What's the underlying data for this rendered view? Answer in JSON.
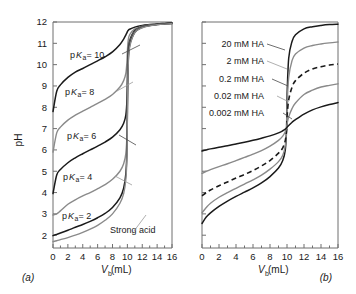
{
  "figure": {
    "panel_a_label": "(a)",
    "panel_b_label": "(b)"
  },
  "axes": {
    "y_title": "pH",
    "x_title_main": "V",
    "x_title_sub": "b",
    "x_title_unit": " (mL)",
    "x_ticklabels": [
      "0",
      "2",
      "4",
      "6",
      "8",
      "10",
      "12",
      "14",
      "16"
    ],
    "y_ticklabels": [
      "2",
      "3",
      "4",
      "5",
      "6",
      "7",
      "8",
      "9",
      "10",
      "11",
      "12"
    ],
    "xlim": [
      0,
      16
    ],
    "ylim": [
      1.4,
      12
    ],
    "x_major_step": 2,
    "y_major_step": 1
  },
  "panel_a": {
    "annotations": [
      {
        "prefix": "p",
        "italic": "K",
        "sub": "a",
        "suffix": " = 10",
        "color": "#1a1a1a"
      },
      {
        "prefix": "p",
        "italic": "K",
        "sub": "a",
        "suffix": " = 8",
        "color": "#8a8a8a"
      },
      {
        "prefix": "p",
        "italic": "K",
        "sub": "a",
        "suffix": " = 6",
        "color": "#1a1a1a"
      },
      {
        "prefix": "p",
        "italic": "K",
        "sub": "a",
        "suffix": " = 4",
        "color": "#8a8a8a"
      },
      {
        "prefix": "p",
        "italic": "K",
        "sub": "a",
        "suffix": " = 2",
        "color": "#1a1a1a"
      },
      {
        "prefix": "",
        "italic": "",
        "sub": "",
        "suffix": "Strong acid",
        "color": "#8a8a8a"
      }
    ]
  },
  "panel_b": {
    "annotations": [
      {
        "label": "20 mM HA",
        "color": "#1a1a1a"
      },
      {
        "label": "2 mM HA",
        "color": "#8a8a8a"
      },
      {
        "label": "0.2 mM HA",
        "color": "#1a1a1a"
      },
      {
        "label": "0.02 mM HA",
        "color": "#8a8a8a"
      },
      {
        "label": "0.002 mM HA",
        "color": "#1a1a1a"
      }
    ]
  },
  "chart_data": {
    "type": "line",
    "title": "",
    "xlabel": "V_b (mL)",
    "ylabel": "pH",
    "xlim": [
      0,
      16
    ],
    "ylim": [
      1.4,
      12
    ],
    "grid": false,
    "legend_position": "inline-annotations",
    "panels": [
      {
        "id": "a",
        "label": "(a)",
        "description": "Titration curves of weak acids of differing pKa with strong base; equivalence point at Vb = 10 mL",
        "series": [
          {
            "name": "pKa = 10",
            "color": "#1a1a1a",
            "style": "solid",
            "x": [
              0,
              0.5,
              1,
              2,
              3,
              4,
              5,
              6,
              7,
              8,
              9,
              9.5,
              9.8,
              9.95,
              10,
              10.1,
              10.3,
              11,
              12,
              13,
              14,
              15,
              16
            ],
            "y": [
              7.8,
              8.75,
              9.05,
              9.4,
              9.65,
              9.82,
              10.0,
              10.18,
              10.37,
              10.6,
              10.95,
              11.2,
              11.4,
              11.5,
              11.55,
              11.6,
              11.66,
              11.76,
              11.84,
              11.88,
              11.91,
              11.93,
              11.95
            ]
          },
          {
            "name": "pKa = 8",
            "color": "#8a8a8a",
            "style": "solid",
            "x": [
              0,
              0.5,
              1,
              2,
              3,
              4,
              5,
              6,
              7,
              8,
              9,
              9.5,
              9.8,
              9.95,
              10,
              10.1,
              10.3,
              11,
              12,
              13,
              14,
              15,
              16
            ],
            "y": [
              5.9,
              6.8,
              7.07,
              7.4,
              7.63,
              7.82,
              8.0,
              8.18,
              8.37,
              8.6,
              8.95,
              9.25,
              9.6,
              10.2,
              10.6,
              11.1,
              11.4,
              11.68,
              11.8,
              11.86,
              11.89,
              11.92,
              11.94
            ]
          },
          {
            "name": "pKa = 6",
            "color": "#1a1a1a",
            "style": "solid",
            "x": [
              0,
              0.5,
              1,
              2,
              3,
              4,
              5,
              6,
              7,
              8,
              9,
              9.5,
              9.8,
              9.95,
              10,
              10.1,
              10.3,
              11,
              12,
              13,
              14,
              15,
              16
            ],
            "y": [
              3.95,
              4.82,
              5.08,
              5.4,
              5.63,
              5.82,
              6.0,
              6.18,
              6.37,
              6.6,
              6.95,
              7.25,
              7.65,
              8.4,
              9.4,
              10.5,
              11.1,
              11.6,
              11.78,
              11.85,
              11.89,
              11.92,
              11.94
            ]
          },
          {
            "name": "pKa = 4",
            "color": "#8a8a8a",
            "style": "solid",
            "x": [
              0,
              0.5,
              1,
              2,
              3,
              4,
              5,
              6,
              7,
              8,
              9,
              9.5,
              9.8,
              9.95,
              10,
              10.1,
              10.3,
              11,
              12,
              13,
              14,
              15,
              16
            ],
            "y": [
              2.95,
              3.0,
              3.14,
              3.45,
              3.66,
              3.84,
              4.0,
              4.18,
              4.37,
              4.62,
              5.0,
              5.35,
              5.85,
              6.8,
              8.3,
              10.2,
              11.0,
              11.56,
              11.77,
              11.85,
              11.89,
              11.91,
              11.93
            ]
          },
          {
            "name": "pKa = 2",
            "color": "#1a1a1a",
            "style": "solid",
            "x": [
              0,
              0.5,
              1,
              2,
              3,
              4,
              5,
              6,
              7,
              8,
              9,
              9.5,
              9.8,
              9.95,
              10,
              10.1,
              10.3,
              11,
              12,
              13,
              14,
              15,
              16
            ],
            "y": [
              1.98,
              2.04,
              2.1,
              2.23,
              2.37,
              2.5,
              2.65,
              2.82,
              3.02,
              3.3,
              3.75,
              4.2,
              4.9,
              6.1,
              7.8,
              10.0,
              10.9,
              11.52,
              11.75,
              11.83,
              11.88,
              11.91,
              11.93
            ]
          },
          {
            "name": "Strong acid",
            "color": "#8a8a8a",
            "style": "solid",
            "x": [
              0,
              0.5,
              1,
              2,
              3,
              4,
              5,
              6,
              7,
              8,
              9,
              9.5,
              9.8,
              9.95,
              10,
              10.1,
              10.3,
              11,
              12,
              13,
              14,
              15,
              16
            ],
            "y": [
              1.7,
              1.74,
              1.79,
              1.89,
              2.0,
              2.13,
              2.28,
              2.46,
              2.7,
              3.0,
              3.5,
              3.95,
              4.65,
              5.8,
              7.5,
              9.8,
              10.8,
              11.5,
              11.73,
              11.82,
              11.87,
              11.9,
              11.92
            ]
          }
        ]
      },
      {
        "id": "b",
        "label": "(b)",
        "description": "Titration curves of a weak acid at decreasing analytical concentrations with strong base; equivalence point near Vb = 10 mL",
        "series": [
          {
            "name": "20 mM HA",
            "color": "#1a1a1a",
            "style": "solid",
            "x": [
              0,
              0.5,
              1,
              2,
              3,
              4,
              5,
              6,
              7,
              8,
              9,
              9.5,
              9.8,
              9.95,
              10,
              10.2,
              10.6,
              11,
              12,
              13,
              14,
              15,
              16
            ],
            "y": [
              2.55,
              2.85,
              3.05,
              3.35,
              3.6,
              3.82,
              4.02,
              4.22,
              4.45,
              4.75,
              5.15,
              5.5,
              6.0,
              7.0,
              8.4,
              10.3,
              11.1,
              11.4,
              11.68,
              11.78,
              11.84,
              11.88,
              11.9
            ]
          },
          {
            "name": "2 mM HA",
            "color": "#8a8a8a",
            "style": "solid",
            "x": [
              0,
              0.5,
              1,
              2,
              3,
              4,
              5,
              6,
              7,
              8,
              9,
              9.5,
              9.8,
              9.95,
              10,
              10.2,
              10.6,
              11,
              12,
              13,
              14,
              15,
              16
            ],
            "y": [
              3.05,
              3.3,
              3.5,
              3.78,
              4.0,
              4.2,
              4.4,
              4.6,
              4.82,
              5.1,
              5.45,
              5.75,
              6.2,
              7.0,
              8.0,
              9.4,
              10.2,
              10.5,
              10.78,
              10.9,
              10.97,
              11.02,
              11.06
            ]
          },
          {
            "name": "0.2 mM HA",
            "color": "#1a1a1a",
            "style": "dashed",
            "x": [
              0,
              0.5,
              1,
              2,
              3,
              4,
              5,
              6,
              7,
              8,
              9,
              9.5,
              9.8,
              9.95,
              10,
              10.2,
              10.6,
              11,
              12,
              13,
              14,
              15,
              16
            ],
            "y": [
              3.85,
              4.0,
              4.12,
              4.32,
              4.5,
              4.68,
              4.85,
              5.03,
              5.25,
              5.5,
              5.85,
              6.1,
              6.45,
              6.95,
              7.5,
              8.35,
              8.95,
              9.25,
              9.6,
              9.8,
              9.9,
              9.98,
              10.03
            ]
          },
          {
            "name": "0.02 mM HA",
            "color": "#8a8a8a",
            "style": "solid",
            "x": [
              0,
              0.5,
              1,
              2,
              3,
              4,
              5,
              6,
              7,
              8,
              9,
              9.5,
              9.8,
              9.95,
              10,
              10.2,
              10.6,
              11,
              12,
              13,
              14,
              15,
              16
            ],
            "y": [
              4.9,
              5.0,
              5.08,
              5.22,
              5.35,
              5.5,
              5.65,
              5.8,
              5.97,
              6.18,
              6.45,
              6.65,
              6.85,
              7.05,
              7.2,
              7.55,
              7.95,
              8.2,
              8.6,
              8.8,
              8.95,
              9.03,
              9.1
            ]
          },
          {
            "name": "0.002 mM HA",
            "color": "#1a1a1a",
            "style": "solid",
            "x": [
              0,
              0.5,
              1,
              2,
              3,
              4,
              5,
              6,
              7,
              8,
              9,
              9.5,
              9.8,
              9.95,
              10,
              10.2,
              10.6,
              11,
              12,
              13,
              14,
              15,
              16
            ],
            "y": [
              5.95,
              6.0,
              6.05,
              6.13,
              6.2,
              6.28,
              6.36,
              6.45,
              6.55,
              6.66,
              6.8,
              6.9,
              6.98,
              7.03,
              7.06,
              7.15,
              7.3,
              7.42,
              7.68,
              7.88,
              8.02,
              8.13,
              8.22
            ]
          }
        ]
      }
    ]
  }
}
